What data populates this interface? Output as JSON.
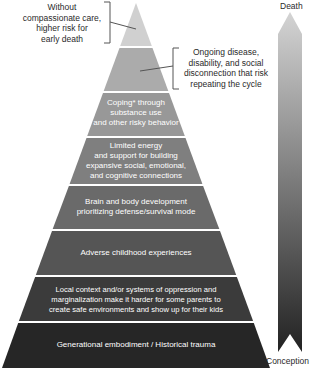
{
  "diagram": {
    "type": "pyramid",
    "tiers": [
      {
        "label": "",
        "color": "#d0d0d0"
      },
      {
        "label": "",
        "color": "#ababab"
      },
      {
        "label": "Coping* through\nsubstance use\nand other risky behavior",
        "color": "#989898"
      },
      {
        "label": "Limited energy\nand support for building\nexpansive social, emotional,\nand cognitive connections",
        "color": "#7f7f7f"
      },
      {
        "label": "Brain and body development\nprioritizing defense/survival mode",
        "color": "#6a6a6a"
      },
      {
        "label": "Adverse childhood experiences",
        "color": "#555555"
      },
      {
        "label": "Local context and/or systems of oppression and\nmarginalization make it harder for some parents to\ncreate safe environments and show up for their kids",
        "color": "#3b3b3b"
      },
      {
        "label": "Generational embodiment / Historical trauma",
        "color": "#262626"
      }
    ],
    "callouts": [
      {
        "text": "Without\ncompassionate care,\nhigher risk for\nearly death",
        "tier_index": 0
      },
      {
        "text": "Ongoing disease,\ndisability, and social\ndisconnection that risk\nrepeating the cycle",
        "tier_index": 1
      }
    ],
    "timeline_arrow": {
      "top_label": "Death",
      "bottom_label": "Conception",
      "gradient_top": "#d4d4d4",
      "gradient_bottom": "#222222"
    }
  }
}
